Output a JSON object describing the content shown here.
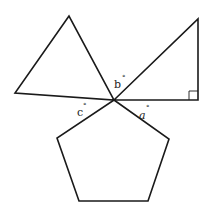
{
  "diagram": {
    "colors": {
      "stroke": "#1a1a1a",
      "background": "#ffffff"
    },
    "shapes": {
      "triangle_left": {
        "type": "triangle",
        "points": "69,16 15,93 114,100"
      },
      "triangle_right": {
        "type": "right-triangle",
        "points": "114,100 198,19 198,100",
        "right_angle_marker": "189,100 189,91 198,91"
      },
      "pentagon": {
        "type": "regular-pentagon",
        "points": "114,100 169,139 148,201 79,201 57,138"
      }
    },
    "labels": {
      "a": {
        "text": "a",
        "degree": "°"
      },
      "b": {
        "text": "b",
        "degree": "°"
      },
      "c": {
        "text": "c",
        "degree": "°"
      }
    }
  }
}
